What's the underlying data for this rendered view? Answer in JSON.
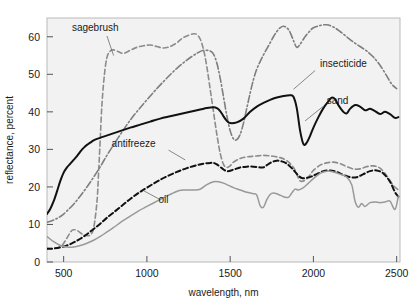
{
  "chart_data": {
    "type": "line",
    "title": "",
    "xlabel": "wavelength, nm",
    "ylabel": "reflectance, percent",
    "xlim": [
      400,
      2520
    ],
    "ylim": [
      0,
      65
    ],
    "xticks": [
      500,
      1000,
      1500,
      2000,
      2500
    ],
    "yticks": [
      0,
      10,
      20,
      30,
      40,
      50,
      60
    ],
    "xtick_labels": [
      "500",
      "1000",
      "1500",
      "2000",
      "2500"
    ],
    "ytick_labels": [
      "0",
      "10",
      "20",
      "30",
      "40",
      "50",
      "60"
    ],
    "grid": false,
    "legend_position": "inline-annotations",
    "background": "#f2f2f2",
    "series": [
      {
        "name": "sagebrush",
        "label": "sagebrush",
        "color": "#8c8c8c",
        "style": "dashed",
        "width": 1.6,
        "label_x": 690,
        "label_y": 61.5,
        "leader": [
          [
            760,
            60.2
          ],
          [
            800,
            55.0
          ]
        ],
        "x": [
          400,
          430,
          460,
          490,
          520,
          545,
          560,
          580,
          600,
          620,
          640,
          660,
          680,
          700,
          710,
          720,
          730,
          745,
          760,
          780,
          800,
          830,
          860,
          900,
          940,
          980,
          1020,
          1060,
          1100,
          1140,
          1180,
          1200,
          1220,
          1250,
          1280,
          1300,
          1320,
          1340,
          1360,
          1380,
          1400,
          1420,
          1440,
          1460,
          1480,
          1500,
          1520,
          1560,
          1600,
          1650,
          1700,
          1750,
          1800,
          1840,
          1880,
          1900,
          1920,
          1950,
          1980,
          2000,
          2040,
          2080,
          2120,
          2160,
          2200,
          2240,
          2280,
          2320,
          2360,
          2400,
          2440,
          2480,
          2510
        ],
        "y": [
          3.6,
          3.6,
          3.8,
          4.4,
          6.4,
          8.2,
          8.6,
          8.4,
          7.8,
          7.2,
          7.0,
          7.2,
          9.0,
          16.0,
          24.0,
          33.0,
          42.0,
          50.0,
          54.5,
          56.2,
          56.5,
          56.0,
          55.6,
          56.4,
          57.2,
          57.6,
          57.8,
          57.4,
          57.0,
          57.4,
          58.4,
          59.2,
          59.8,
          60.4,
          60.8,
          60.6,
          59.4,
          56.6,
          52.0,
          46.0,
          40.0,
          34.0,
          29.0,
          26.0,
          25.2,
          25.6,
          26.6,
          27.6,
          28.0,
          28.2,
          28.4,
          28.2,
          27.8,
          27.0,
          25.2,
          23.4,
          21.6,
          21.8,
          23.2,
          24.4,
          25.8,
          26.4,
          26.6,
          26.2,
          25.4,
          24.8,
          24.8,
          25.4,
          25.6,
          25.0,
          23.0,
          20.4,
          19.2
        ]
      },
      {
        "name": "insecticide",
        "label": "insecticide",
        "color": "#7e7e7e",
        "style": "dashdot",
        "width": 1.6,
        "label_x": 2040,
        "label_y": 52.0,
        "leader": [
          [
            2010,
            51.0
          ],
          [
            1880,
            46.0
          ]
        ],
        "x": [
          400,
          430,
          460,
          490,
          520,
          560,
          600,
          640,
          680,
          720,
          760,
          800,
          850,
          900,
          950,
          1000,
          1060,
          1120,
          1180,
          1240,
          1300,
          1340,
          1380,
          1400,
          1420,
          1440,
          1460,
          1480,
          1500,
          1520,
          1540,
          1560,
          1580,
          1600,
          1620,
          1640,
          1660,
          1680,
          1700,
          1720,
          1740,
          1760,
          1780,
          1800,
          1820,
          1840,
          1860,
          1880,
          1900,
          1920,
          1950,
          1980,
          2000,
          2040,
          2080,
          2120,
          2160,
          2200,
          2240,
          2280,
          2320,
          2360,
          2400,
          2440,
          2470,
          2500
        ],
        "y": [
          10.6,
          11.0,
          11.6,
          12.4,
          13.6,
          15.4,
          17.6,
          20.0,
          22.6,
          25.4,
          28.4,
          31.2,
          34.6,
          37.8,
          40.6,
          43.2,
          46.2,
          49.0,
          51.6,
          53.8,
          55.6,
          56.4,
          56.2,
          55.4,
          53.0,
          49.0,
          44.0,
          39.0,
          35.0,
          32.8,
          32.6,
          34.0,
          37.0,
          41.0,
          45.0,
          48.6,
          51.4,
          53.4,
          55.2,
          56.8,
          58.4,
          60.0,
          61.4,
          62.4,
          62.8,
          62.4,
          61.2,
          59.0,
          57.2,
          58.0,
          60.0,
          61.6,
          62.4,
          63.0,
          63.2,
          62.6,
          61.4,
          60.0,
          58.6,
          57.4,
          56.2,
          54.6,
          52.4,
          49.6,
          47.4,
          46.2
        ]
      },
      {
        "name": "sand",
        "label": "sand",
        "color": "#111111",
        "style": "solid",
        "width": 2.0,
        "label_x": 2080,
        "label_y": 42.2,
        "leader": [
          [
            2060,
            41.5
          ],
          [
            1950,
            37.6
          ]
        ],
        "x": [
          400,
          420,
          440,
          460,
          480,
          500,
          520,
          540,
          560,
          580,
          600,
          620,
          640,
          660,
          680,
          700,
          740,
          780,
          820,
          860,
          900,
          960,
          1020,
          1080,
          1140,
          1200,
          1260,
          1320,
          1360,
          1400,
          1420,
          1440,
          1460,
          1480,
          1500,
          1540,
          1580,
          1620,
          1660,
          1700,
          1740,
          1780,
          1820,
          1860,
          1880,
          1900,
          1920,
          1940,
          1960,
          1980,
          2000,
          2030,
          2060,
          2090,
          2110,
          2130,
          2150,
          2180,
          2200,
          2220,
          2250,
          2280,
          2310,
          2340,
          2370,
          2400,
          2430,
          2460,
          2490,
          2510
        ],
        "y": [
          12.8,
          14.2,
          16.2,
          18.8,
          21.6,
          23.8,
          25.2,
          26.2,
          27.2,
          28.2,
          29.4,
          30.4,
          31.2,
          31.8,
          32.4,
          32.8,
          33.4,
          34.0,
          34.6,
          35.2,
          35.8,
          36.6,
          37.4,
          38.2,
          38.8,
          39.4,
          40.0,
          40.6,
          41.0,
          41.2,
          41.0,
          40.2,
          38.8,
          37.6,
          37.0,
          37.2,
          38.2,
          40.0,
          41.4,
          42.4,
          43.2,
          43.8,
          44.2,
          44.4,
          44.0,
          41.0,
          35.0,
          31.4,
          31.8,
          33.6,
          35.8,
          38.6,
          41.0,
          42.8,
          43.8,
          43.4,
          41.8,
          40.0,
          39.6,
          40.8,
          41.8,
          41.4,
          40.4,
          40.8,
          40.2,
          39.4,
          40.0,
          39.4,
          38.4,
          38.6
        ]
      },
      {
        "name": "antifreeze",
        "label": "antifreeze",
        "color": "#111111",
        "style": "dashed",
        "width": 2.0,
        "label_x": 920,
        "label_y": 30.6,
        "leader": [
          [
            1130,
            29.8
          ],
          [
            1230,
            27.2
          ]
        ],
        "x": [
          400,
          440,
          480,
          520,
          560,
          600,
          640,
          680,
          720,
          760,
          800,
          850,
          900,
          950,
          1000,
          1060,
          1120,
          1180,
          1240,
          1300,
          1340,
          1380,
          1400,
          1420,
          1450,
          1480,
          1520,
          1560,
          1600,
          1640,
          1680,
          1700,
          1720,
          1750,
          1780,
          1810,
          1840,
          1870,
          1890,
          1910,
          1930,
          1960,
          1990,
          2020,
          2060,
          2100,
          2140,
          2180,
          2220,
          2260,
          2300,
          2340,
          2380,
          2420,
          2460,
          2490,
          2510
        ],
        "y": [
          3.5,
          3.6,
          3.9,
          4.4,
          5.2,
          6.2,
          7.4,
          8.8,
          10.2,
          11.8,
          13.2,
          15.0,
          16.8,
          18.4,
          19.8,
          21.4,
          22.8,
          24.0,
          25.0,
          25.8,
          26.2,
          26.4,
          26.4,
          26.0,
          25.0,
          24.2,
          24.6,
          25.2,
          25.4,
          25.4,
          25.2,
          25.2,
          25.8,
          26.6,
          27.0,
          26.8,
          26.2,
          25.0,
          24.0,
          23.0,
          22.4,
          22.4,
          22.8,
          23.4,
          24.2,
          24.4,
          24.0,
          23.2,
          22.6,
          22.6,
          23.4,
          24.2,
          24.4,
          23.6,
          21.4,
          18.6,
          17.4
        ]
      },
      {
        "name": "oil",
        "label": "oil",
        "color": "#999999",
        "style": "solid",
        "width": 1.5,
        "label_x": 1100,
        "label_y": 15.8,
        "leader": [
          [
            1080,
            16.6
          ],
          [
            980,
            19.0
          ]
        ],
        "x": [
          400,
          440,
          480,
          520,
          560,
          600,
          640,
          680,
          720,
          760,
          800,
          850,
          900,
          950,
          1000,
          1060,
          1120,
          1160,
          1190,
          1220,
          1250,
          1280,
          1320,
          1360,
          1400,
          1430,
          1460,
          1490,
          1520,
          1560,
          1600,
          1640,
          1660,
          1680,
          1700,
          1720,
          1740,
          1760,
          1790,
          1820,
          1850,
          1870,
          1890,
          1910,
          1940,
          1970,
          2000,
          2040,
          2080,
          2120,
          2160,
          2200,
          2230,
          2250,
          2270,
          2290,
          2310,
          2340,
          2370,
          2400,
          2430,
          2460,
          2490,
          2510
        ],
        "y": [
          6.8,
          5.4,
          4.4,
          4.0,
          4.0,
          4.4,
          5.0,
          5.8,
          6.8,
          8.0,
          9.2,
          10.8,
          12.2,
          13.6,
          14.8,
          16.2,
          17.6,
          18.4,
          19.0,
          19.2,
          19.2,
          19.2,
          19.4,
          20.6,
          21.4,
          21.4,
          21.0,
          20.4,
          19.8,
          19.2,
          18.6,
          18.2,
          17.8,
          15.0,
          14.6,
          16.6,
          18.0,
          18.4,
          18.0,
          17.4,
          17.2,
          18.4,
          19.4,
          19.2,
          19.8,
          21.0,
          22.2,
          23.6,
          24.2,
          24.0,
          23.4,
          22.6,
          20.6,
          16.2,
          14.6,
          15.6,
          14.8,
          15.8,
          16.0,
          15.8,
          16.0,
          16.2,
          14.0,
          17.6
        ]
      }
    ]
  }
}
